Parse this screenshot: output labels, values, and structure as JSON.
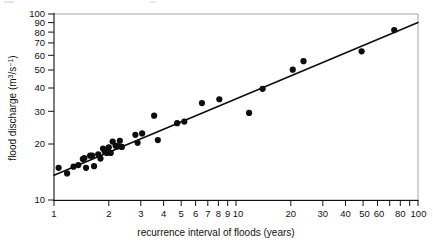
{
  "figure": {
    "background": "#ffffff",
    "ink_color": "#0d0d0d",
    "frame_color": "#9a9a9a"
  },
  "axes": {
    "x": {
      "title": "recurrence interval of floods (years)",
      "scale": "log",
      "min": 1,
      "max": 100,
      "tick_values": [
        1,
        2,
        3,
        4,
        5,
        6,
        7,
        8,
        9,
        10,
        20,
        30,
        40,
        50,
        60,
        80,
        100
      ],
      "tick_labels": [
        "1",
        "2",
        "3",
        "4",
        "5",
        "6",
        "7",
        "8",
        "9",
        "10",
        "20",
        "30",
        "40",
        "50",
        "60",
        "80",
        "100"
      ],
      "minor_tick_values": [
        70,
        90
      ]
    },
    "y": {
      "title": "flood discharge (m3/s-1)",
      "title_parts": {
        "lead": "flood discharge (m",
        "sup1": "3",
        "mid": "/s",
        "sup2": "−1",
        "tail": ")"
      },
      "scale": "log",
      "min": 10,
      "max": 100,
      "tick_values": [
        10,
        20,
        30,
        40,
        50,
        60,
        70,
        80,
        90,
        100
      ],
      "tick_labels": [
        "10",
        "20",
        "30",
        "40",
        "50",
        "60",
        "70",
        "80",
        "90",
        "100"
      ]
    }
  },
  "chart_data": {
    "type": "scatter",
    "title": "",
    "xlabel": "recurrence interval of floods (years)",
    "ylabel": "flood discharge (m3/s-1)",
    "xscale": "log",
    "yscale": "log",
    "xlim": [
      1,
      100
    ],
    "ylim": [
      10,
      100
    ],
    "grid": false,
    "legend": "none",
    "marker": "filled-circle",
    "marker_size_px": 3.1,
    "series": [
      {
        "name": "flood discharge observations",
        "points": [
          [
            1.06,
            14.9
          ],
          [
            1.18,
            13.9
          ],
          [
            1.28,
            15.1
          ],
          [
            1.36,
            15.4
          ],
          [
            1.44,
            16.6
          ],
          [
            1.47,
            16.8
          ],
          [
            1.5,
            14.9
          ],
          [
            1.58,
            17.3
          ],
          [
            1.62,
            17.3
          ],
          [
            1.66,
            15.2
          ],
          [
            1.75,
            17.6
          ],
          [
            1.8,
            16.7
          ],
          [
            1.86,
            18.9
          ],
          [
            1.9,
            18.3
          ],
          [
            1.95,
            17.9
          ],
          [
            2.0,
            19.2
          ],
          [
            2.05,
            17.9
          ],
          [
            2.1,
            20.6
          ],
          [
            2.18,
            19.6
          ],
          [
            2.24,
            19.4
          ],
          [
            2.3,
            20.8
          ],
          [
            2.36,
            19.3
          ],
          [
            2.8,
            22.4
          ],
          [
            2.88,
            20.3
          ],
          [
            3.05,
            22.8
          ],
          [
            3.55,
            28.4
          ],
          [
            3.72,
            21.0
          ],
          [
            4.75,
            25.9
          ],
          [
            5.2,
            26.4
          ],
          [
            6.5,
            33.2
          ],
          [
            8.1,
            34.8
          ],
          [
            11.8,
            29.4
          ],
          [
            14.0,
            39.6
          ],
          [
            20.5,
            50.2
          ],
          [
            23.5,
            55.8
          ],
          [
            49.0,
            63.0
          ],
          [
            74.0,
            82.0
          ]
        ]
      }
    ],
    "trend_line": {
      "name": "fitted regression line",
      "type": "power-law",
      "endpoints": [
        [
          1.0,
          13.6
        ],
        [
          100.0,
          90.0
        ]
      ]
    }
  }
}
